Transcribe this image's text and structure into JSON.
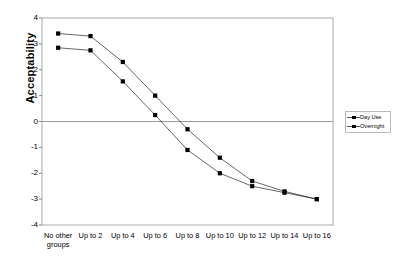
{
  "chart_data": {
    "type": "line",
    "title": "",
    "xlabel": "",
    "ylabel": "Acceptability",
    "ylim": [
      -4,
      4
    ],
    "ytick_labels": [
      "4",
      "3",
      "2",
      "1",
      "0",
      "-1",
      "-2",
      "-3",
      "-4"
    ],
    "ytick_values": [
      4,
      3,
      2,
      1,
      0,
      -1,
      -2,
      -3,
      -4
    ],
    "grid": "zero-line-only",
    "legend_position": "right",
    "categories": [
      "No other groups",
      "Up to 2",
      "Up to 4",
      "Up to 6",
      "Up to 8",
      "Up to 10",
      "Up to 12",
      "Up to 14",
      "Up to 16"
    ],
    "series": [
      {
        "name": "Day Use",
        "marker": "square",
        "color": "#000000",
        "values": [
          3.4,
          3.3,
          2.3,
          1.0,
          -0.3,
          -1.4,
          -2.3,
          -2.7,
          -3.0
        ]
      },
      {
        "name": "Overnight",
        "marker": "square",
        "color": "#000000",
        "values": [
          2.85,
          2.75,
          1.55,
          0.25,
          -1.1,
          -2.0,
          -2.5,
          -2.75,
          -3.0
        ]
      }
    ]
  },
  "legend": {
    "entries": [
      "Day Use",
      "Overnight"
    ]
  },
  "axis": {
    "y_title": "Acceptability"
  }
}
